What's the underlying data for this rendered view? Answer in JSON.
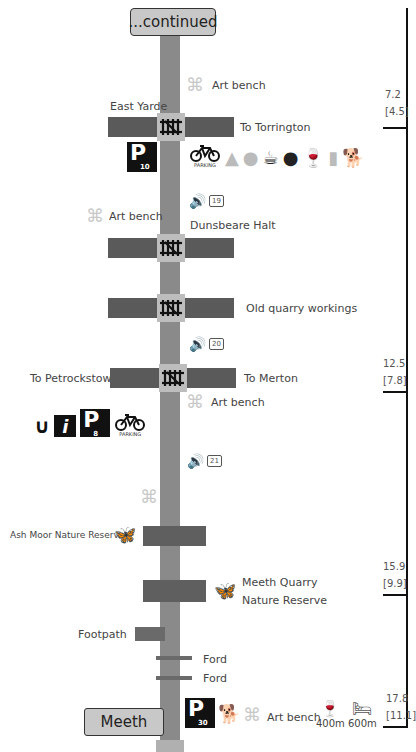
{
  "header": {
    "continued_label": "...continued"
  },
  "end_station": {
    "label": "Meeth"
  },
  "colors": {
    "trunk": "#8a8a8a",
    "road": "#5a5a5a",
    "crossing": "#bdbdbd",
    "art_bench": "#c8c8c8",
    "text": "#444444"
  },
  "waypoints": [
    {
      "name": "Art bench",
      "icon": "art-bench-icon"
    },
    {
      "name": "East Yarde",
      "to_label": "To Torrington",
      "icon": "level-crossing-icon"
    },
    {
      "parking_number": "10",
      "amenities": [
        "bicycle-parking-icon",
        "camping-icon",
        "caravan-icon",
        "cafe-icon",
        "restaurant-icon",
        "wine-glass-icon",
        "beer-glass-icon",
        "dog-icon"
      ],
      "bike_parking_label": "PARKING"
    },
    {
      "audio_number": "19",
      "icon": "audio-icon"
    },
    {
      "name": "Art bench",
      "icon": "art-bench-icon"
    },
    {
      "name": "Dunsbeare Halt",
      "icon": "level-crossing-icon"
    },
    {
      "name": "Old quarry workings",
      "icon": "level-crossing-icon"
    },
    {
      "audio_number": "20",
      "icon": "audio-icon"
    },
    {
      "left_label": "To Petrockstowe",
      "right_label": "To  Merton",
      "icon": "level-crossing-icon"
    },
    {
      "name": "Art bench",
      "icon": "art-bench-icon"
    },
    {
      "parking_number": "8",
      "amenities": [
        "horseshoe-icon",
        "info-icon",
        "parking-icon",
        "bicycle-parking-icon"
      ],
      "bike_parking_label": "PARKING"
    },
    {
      "audio_number": "21",
      "icon": "audio-icon"
    },
    {
      "name": "",
      "icon": "art-bench-icon"
    },
    {
      "name": "Ash Moor Nature Reserve",
      "icon": "butterfly-icon"
    },
    {
      "name_line1": "Meeth Quarry",
      "name_line2": "Nature Reserve",
      "icon": "butterfly-icon"
    },
    {
      "name": "Footpath"
    },
    {
      "name": "Ford"
    },
    {
      "name": "Ford"
    },
    {
      "parking_number": "30",
      "bench_label": "Art bench",
      "pub_distance": "400m",
      "bed_distance": "600m"
    }
  ],
  "distances": [
    {
      "km": "7.2",
      "miles": "[4.5]"
    },
    {
      "km": "12.5",
      "miles": "[7.8]"
    },
    {
      "km": "15.9",
      "miles": "[9.9]"
    },
    {
      "km": "17.8",
      "miles": "[11.1]"
    }
  ]
}
